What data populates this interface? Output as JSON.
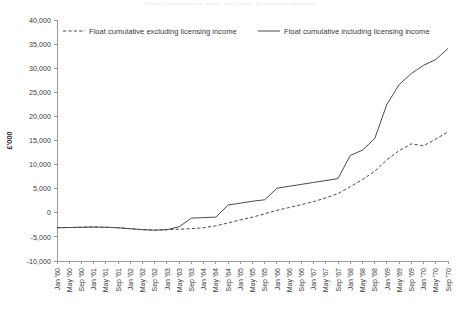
{
  "title": "Float cumulative excl. and incl. licensing income",
  "legend": {
    "position": "top",
    "entries": [
      {
        "label": "Float cumulative excluding licensing income",
        "style": "dashed",
        "color": "#4a4a4a"
      },
      {
        "label": "Float cumulative including licensing income",
        "style": "solid",
        "color": "#4a4a4a"
      }
    ]
  },
  "axes": {
    "ylabel": "£'000",
    "yticks": [
      "40,000",
      "35,000",
      "30,000",
      "25,000",
      "20,000",
      "15,000",
      "10,000",
      "5,000",
      "0",
      "-5,000",
      "-10,000"
    ],
    "ytick_values": [
      40000,
      35000,
      30000,
      25000,
      20000,
      15000,
      10000,
      5000,
      0,
      -5000,
      -10000
    ],
    "ylim": [
      -10000,
      40000
    ],
    "xlabel": "",
    "grid": false
  },
  "chart_data": {
    "type": "line",
    "title": "Float cumulative excl. and incl. licensing income",
    "xlabel": "",
    "ylabel": "£'000",
    "ylim": [
      -10000,
      40000
    ],
    "grid": false,
    "legend_position": "top",
    "categories": [
      "Jan '60",
      "May '60",
      "Sep '60",
      "Jan '61",
      "May '61",
      "Sep '61",
      "Jan '62",
      "May '62",
      "Sep '62",
      "Jan '63",
      "May '63",
      "Sep '63",
      "Jan '64",
      "May '64",
      "Sep '64",
      "Jan '65",
      "May '65",
      "Sep '65",
      "Jan '66",
      "May '66",
      "Sep '66",
      "Jan '67",
      "May '67",
      "Sep '67",
      "Jan '68",
      "May '68",
      "Sep '68",
      "Jan '69",
      "May '69",
      "Sep '69",
      "Jan '70",
      "May '70",
      "Sep '70"
    ],
    "series": [
      {
        "name": "Float cumulative including licensing income",
        "style": "solid",
        "color": "#4a4a4a",
        "values": [
          -3100,
          -3050,
          -3000,
          -2950,
          -3000,
          -3100,
          -3300,
          -3500,
          -3600,
          -3500,
          -2900,
          -1100,
          -1000,
          -900,
          1600,
          2000,
          2400,
          2700,
          5100,
          5500,
          5900,
          6300,
          6700,
          7100,
          11900,
          13000,
          15400,
          22500,
          26600,
          28900,
          30600,
          31800,
          34100
        ]
      },
      {
        "name": "Float cumulative excluding licensing income",
        "style": "dashed",
        "color": "#4a4a4a",
        "values": [
          -3100,
          -3050,
          -3000,
          -2950,
          -3000,
          -3100,
          -3300,
          -3500,
          -3600,
          -3500,
          -3400,
          -3300,
          -3100,
          -2700,
          -2100,
          -1500,
          -900,
          -200,
          500,
          1100,
          1700,
          2300,
          3100,
          4000,
          5400,
          6900,
          8600,
          11000,
          12900,
          14300,
          13900,
          15300,
          16800
        ]
      }
    ]
  }
}
